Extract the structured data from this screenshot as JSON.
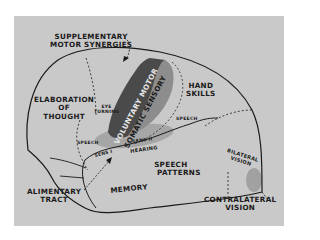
{
  "figure": {
    "type": "brain-lateral-view-functional-map",
    "colors": {
      "background": "#ffffff",
      "panel": "#c9c9c9",
      "outline": "#1a1a1a",
      "motor_strip": "#4a4a4a",
      "sensory_strip": "#8d8d8d",
      "hearing_area": "#a3a3a3",
      "vision_spot": "#9a9a9a"
    },
    "labels": {
      "supplementary_motor": [
        "SUPPLEMENTARY",
        "MOTOR SYNERGIES"
      ],
      "elaboration_of_thought": [
        "ELABORATION",
        "OF",
        "THOUGHT"
      ],
      "eye_turning": [
        "EYE",
        "TURNING"
      ],
      "voluntary_motor": "VOLUNTARY MOTOR",
      "somatic_sensory": "SOMATIC SENSORY",
      "hand_skills": [
        "HAND",
        "SKILLS"
      ],
      "speech_left": "SPEECH",
      "speech_right": "SPEECH",
      "sens_1": "SENS I",
      "sens_2": "SENS II",
      "hearing": "HEARING",
      "speech_patterns": [
        "SPEECH",
        "PATTERNS"
      ],
      "memory": "MEMORY",
      "alimentary_tract": [
        "ALIMENTARY",
        "TRACT"
      ],
      "bilateral_vision": [
        "BILATERAL",
        "VISION"
      ],
      "contralateral_vision": [
        "CONTRALATERAL",
        "VISION"
      ]
    }
  }
}
